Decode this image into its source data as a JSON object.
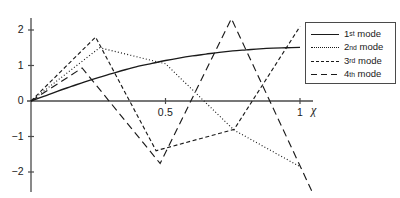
{
  "chart_data": {
    "type": "line",
    "title": "",
    "xlabel": "χ",
    "ylabel": "",
    "xlim": [
      0,
      1
    ],
    "ylim": [
      -2.45,
      2.45
    ],
    "grid": false,
    "legend_position": "top-right",
    "xticks": [
      {
        "value": 0.5,
        "label": "0.5"
      },
      {
        "value": 1.0,
        "label": "1"
      }
    ],
    "yticks": [
      {
        "value": 2,
        "label": "2"
      },
      {
        "value": 1,
        "label": "1"
      },
      {
        "value": 0,
        "label": "0"
      },
      {
        "value": -1,
        "label": "−1"
      },
      {
        "value": -2,
        "label": "−2"
      }
    ],
    "series": [
      {
        "name": "1st mode",
        "ordinal": "1",
        "suffix": "st",
        "style": "solid",
        "color": "#1a1a1a",
        "smooth": true,
        "x": [
          0,
          0.05,
          0.1,
          0.15,
          0.2,
          0.25,
          0.3,
          0.35,
          0.4,
          0.45,
          0.5,
          0.55,
          0.6,
          0.65,
          0.7,
          0.75,
          0.8,
          0.85,
          0.9,
          0.95,
          1.0
        ],
        "y": [
          0,
          0.14,
          0.28,
          0.41,
          0.54,
          0.66,
          0.77,
          0.88,
          0.98,
          1.06,
          1.14,
          1.21,
          1.27,
          1.32,
          1.37,
          1.41,
          1.44,
          1.47,
          1.49,
          1.5,
          1.51
        ]
      },
      {
        "name": "2nd mode",
        "ordinal": "2",
        "suffix": "nd",
        "style": "dotted",
        "color": "#1a1a1a",
        "smooth": false,
        "x": [
          0,
          0.255,
          0.5,
          0.755,
          1.0
        ],
        "y": [
          0,
          1.5,
          1.05,
          -0.82,
          -1.85
        ]
      },
      {
        "name": "3rd mode",
        "ordinal": "3",
        "suffix": "rd",
        "style": "dashed",
        "color": "#1a1a1a",
        "smooth": false,
        "x": [
          0,
          0.24,
          0.465,
          0.755,
          1.0
        ],
        "y": [
          0,
          1.8,
          -1.4,
          -0.8,
          2.1
        ]
      },
      {
        "name": "4th mode",
        "ordinal": "4",
        "suffix": "th",
        "style": "longdash",
        "color": "#1a1a1a",
        "smooth": false,
        "x": [
          0,
          0.19,
          0.48,
          0.745,
          1.06
        ],
        "y": [
          0,
          0.93,
          -1.76,
          2.32,
          -2.8
        ]
      }
    ]
  },
  "legend": {
    "entries": [
      {
        "label": "1st mode",
        "ordinal": "1",
        "suffix": "st",
        "style": "solid"
      },
      {
        "label": "2nd mode",
        "ordinal": "2",
        "suffix": "nd",
        "style": "dotted"
      },
      {
        "label": "3rd mode",
        "ordinal": "3",
        "suffix": "rd",
        "style": "dashed"
      },
      {
        "label": "4th mode",
        "ordinal": "4",
        "suffix": "th",
        "style": "longdash"
      }
    ]
  },
  "axes": {
    "x_axis_label": "χ",
    "y_tick_labels": [
      "2",
      "1",
      "0",
      "−1",
      "−2"
    ],
    "x_tick_labels": [
      "0.5",
      "1"
    ]
  },
  "colors": {
    "line": "#1a1a1a",
    "axis": "#4a4a4a",
    "background": "#ffffff"
  }
}
